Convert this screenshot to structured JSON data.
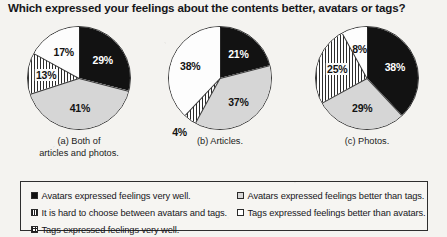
{
  "title": "Which expressed your feelings about the contents better, avatars or tags?",
  "chart_data": [
    {
      "type": "pie",
      "title": "(a) Both of articles and photos.",
      "caption_line1": "(a) Both of",
      "caption_line2": "articles and photos.",
      "categories": [
        "Avatars expressed feelings very well.",
        "Avatars expressed feelings better than tags.",
        "It is hard to choose between avatars and tags.",
        "Tags expressed feelings better than avatars."
      ],
      "values": [
        29,
        41,
        13,
        17
      ],
      "labels": [
        "29%",
        "41%",
        "13%",
        "17%"
      ],
      "fills": [
        "black",
        "gray",
        "stripe",
        "white"
      ]
    },
    {
      "type": "pie",
      "title": "(b) Articles.",
      "caption_line1": "(b) Articles.",
      "caption_line2": "",
      "categories": [
        "Avatars expressed feelings very well.",
        "Avatars expressed feelings better than tags.",
        "It is hard to choose between avatars and tags.",
        "Tags expressed feelings better than avatars."
      ],
      "values": [
        21,
        37,
        4,
        38
      ],
      "labels": [
        "21%",
        "37%",
        "4%",
        "38%"
      ],
      "fills": [
        "black",
        "gray",
        "stripe",
        "white"
      ]
    },
    {
      "type": "pie",
      "title": "(c) Photos.",
      "caption_line1": "(c) Photos.",
      "caption_line2": "",
      "categories": [
        "Avatars expressed feelings very well.",
        "Avatars expressed feelings better than tags.",
        "It is hard to choose between avatars and tags.",
        "Tags expressed feelings better than avatars."
      ],
      "values": [
        38,
        29,
        25,
        8
      ],
      "labels": [
        "38%",
        "29%",
        "25%",
        "8%"
      ],
      "fills": [
        "black",
        "gray",
        "stripe",
        "white"
      ]
    }
  ],
  "legend": {
    "left": [
      {
        "swatch": "black",
        "text": "Avatars expressed feelings very well."
      },
      {
        "swatch": "stripe",
        "text": "It is hard to choose between avatars and tags."
      },
      {
        "swatch": "cross",
        "text": "Tags expressed feelings very well."
      }
    ],
    "right": [
      {
        "swatch": "gray",
        "text": "Avatars expressed feelings better than tags."
      },
      {
        "swatch": "white",
        "text": "Tags expressed feelings better than avatars."
      }
    ]
  },
  "colors": {
    "black": "#121212",
    "gray": "#d6d6d6",
    "white": "#fdfdfd",
    "stripe_ink": "#2b2b2b",
    "outline": "#3a3a3a",
    "background": "#f4f3f0"
  }
}
